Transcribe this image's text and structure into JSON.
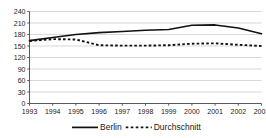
{
  "chart_data": {
    "type": "line",
    "title": "",
    "subtitle": "",
    "xlabel": "",
    "ylabel": "",
    "categories": [
      "1993",
      "1994",
      "1995",
      "1996",
      "1997",
      "1998",
      "1999",
      "2000",
      "2001",
      "2002",
      "2003"
    ],
    "x": [
      1993,
      1994,
      1995,
      1996,
      1997,
      1998,
      1999,
      2000,
      2001,
      2002,
      2003
    ],
    "ylim": [
      0,
      240
    ],
    "yticks": [
      0,
      30,
      60,
      90,
      120,
      150,
      180,
      210,
      240
    ],
    "ytick_labels": [
      "0",
      "30",
      "60",
      "90",
      "120",
      "150",
      "180",
      "210",
      "240"
    ],
    "xtick_labels": [
      "1993",
      "1994",
      "1995",
      "1996",
      "1997",
      "1998",
      "1999",
      "2000",
      "2001",
      "2002",
      "2003"
    ],
    "grid": true,
    "grid_axis": "y",
    "legend_position": "bottom",
    "series": [
      {
        "name": "Berlin",
        "style": "solid",
        "color": "#111111",
        "values": [
          164,
          172,
          180,
          185,
          188,
          191,
          193,
          204,
          205,
          197,
          182
        ]
      },
      {
        "name": "Durchschnitt",
        "style": "dashed",
        "color": "#111111",
        "values": [
          163,
          168,
          167,
          152,
          151,
          151,
          152,
          156,
          157,
          153,
          150
        ]
      }
    ]
  },
  "legend": {
    "items": [
      {
        "label": "Berlin",
        "style": "solid"
      },
      {
        "label": "Durchschnitt",
        "style": "dashed"
      }
    ]
  }
}
